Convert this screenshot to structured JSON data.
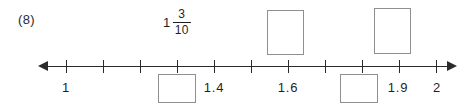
{
  "worksheet": {
    "question_number": "(8)"
  },
  "number_line": {
    "start_value": "1",
    "end_value": "2",
    "left_arrow_icon": "arrow-left-icon",
    "right_arrow_icon": "arrow-right-icon",
    "tick_values": [
      "1",
      "1.1",
      "1.2",
      "1.3",
      "1.4",
      "1.5",
      "1.6",
      "1.7",
      "1.8",
      "1.9",
      "2"
    ],
    "visible_labels": [
      {
        "value": "1",
        "x": 66
      },
      {
        "value": "1.4",
        "x": 214
      },
      {
        "value": "1.6",
        "x": 288
      },
      {
        "value": "1.9",
        "x": 398
      },
      {
        "value": "2",
        "x": 437
      }
    ],
    "ticks_x": [
      66,
      103,
      140,
      177,
      214,
      251,
      288,
      325,
      362,
      399,
      436
    ]
  },
  "annotations": {
    "mixed_fraction": {
      "whole": "1",
      "numerator": "3",
      "denominator": "10",
      "x": 177
    }
  },
  "answer_boxes": [
    {
      "id": "box-below-1-3",
      "position": "below",
      "x": 158,
      "y": 74,
      "width": 38,
      "height": 29
    },
    {
      "id": "box-below-1-8",
      "position": "below",
      "x": 340,
      "y": 74,
      "width": 38,
      "height": 29
    },
    {
      "id": "box-above-1-6",
      "position": "above",
      "x": 267,
      "y": 10,
      "width": 37,
      "height": 45
    },
    {
      "id": "box-above-1-9",
      "position": "above",
      "x": 374,
      "y": 8,
      "width": 37,
      "height": 46
    }
  ],
  "colors": {
    "ink": "#2b2b2b",
    "box_border": "#8f8f8f",
    "background": "#ffffff"
  }
}
